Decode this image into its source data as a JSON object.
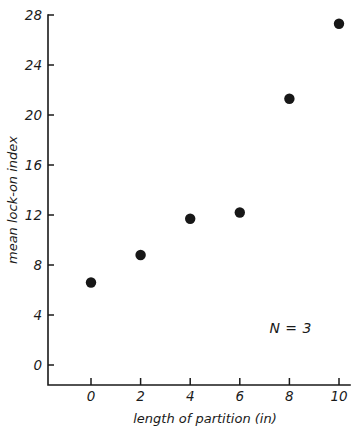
{
  "chart_data": {
    "type": "scatter",
    "title": "",
    "xlabel": "length of partition (in)",
    "ylabel": "mean lock-on index",
    "xlim": [
      -1.5,
      10.6
    ],
    "ylim": [
      -1.6,
      28.8
    ],
    "grid": false,
    "legend": null,
    "x": [
      0,
      2,
      4,
      6,
      8,
      10
    ],
    "values": [
      6.6,
      8.8,
      11.7,
      12.2,
      21.3,
      27.3
    ],
    "series": [
      {
        "name": "mean lock-on index",
        "marker": "filled-circle",
        "color": "#171717",
        "points": [
          {
            "x": 0,
            "y": 6.6
          },
          {
            "x": 2,
            "y": 8.8
          },
          {
            "x": 4,
            "y": 11.7
          },
          {
            "x": 6,
            "y": 12.2
          },
          {
            "x": 8,
            "y": 21.3
          },
          {
            "x": 10,
            "y": 27.3
          }
        ]
      }
    ],
    "xticks": [
      {
        "value": 0,
        "label": "0"
      },
      {
        "value": 2,
        "label": "2"
      },
      {
        "value": 4,
        "label": "4"
      },
      {
        "value": 6,
        "label": "6"
      },
      {
        "value": 8,
        "label": "8"
      },
      {
        "value": 10,
        "label": "10"
      }
    ],
    "yticks": [
      {
        "value": 0,
        "label": "0"
      },
      {
        "value": 4,
        "label": "4"
      },
      {
        "value": 8,
        "label": "8"
      },
      {
        "value": 12,
        "label": "12"
      },
      {
        "value": 16,
        "label": "16"
      },
      {
        "value": 20,
        "label": "20"
      },
      {
        "value": 24,
        "label": "24"
      },
      {
        "value": 28,
        "label": "28"
      }
    ],
    "annotations": [
      {
        "text": "N = 3",
        "x": 8.05,
        "y": 2.55
      }
    ],
    "axis_color": "#1a1a1a",
    "background": "#ffffff"
  }
}
